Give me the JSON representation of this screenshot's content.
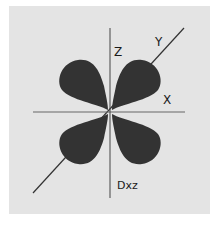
{
  "diagram": {
    "title": "Dxz",
    "axes": {
      "z_label": "Z",
      "x_label": "X",
      "y_label": "Y"
    },
    "orbital": {
      "name": "Dxz",
      "lobe_count": 4,
      "lobe_color": "#333333"
    },
    "colors": {
      "background": "#e4e4e4",
      "axis": "#555555",
      "lobe": "#333333"
    }
  }
}
